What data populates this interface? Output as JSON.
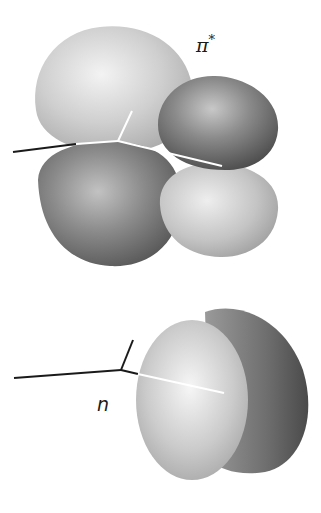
{
  "figure": {
    "type": "molecular-orbital-illustration",
    "panels": [
      {
        "id": "pi-star",
        "label": "π",
        "label_superscript": "*",
        "lobes": [
          {
            "position": "upper-left",
            "shade": "light"
          },
          {
            "position": "upper-right",
            "shade": "dark"
          },
          {
            "position": "lower-left",
            "shade": "dark"
          },
          {
            "position": "lower-right",
            "shade": "light"
          }
        ]
      },
      {
        "id": "n",
        "label": "n",
        "lobes": [
          {
            "position": "front",
            "shade": "light"
          },
          {
            "position": "back",
            "shade": "dark"
          }
        ]
      }
    ]
  },
  "colors": {
    "light_lobe": "#c8c8c8",
    "light_lobe_highlight": "#f2f2f2",
    "dark_lobe": "#7a7a7a",
    "dark_lobe_highlight": "#b5b5b5",
    "bond_outside": "#1a1a1a",
    "bond_inside": "#ffffff",
    "background": "#ffffff"
  }
}
